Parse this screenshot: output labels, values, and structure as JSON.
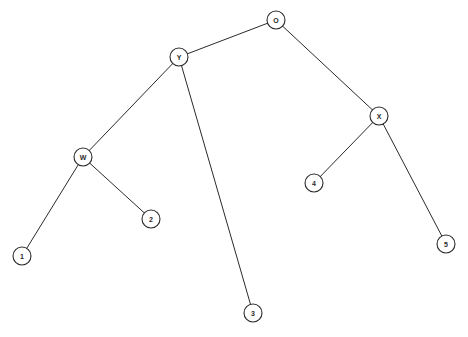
{
  "diagram": {
    "type": "tree",
    "node_radius": 9,
    "colors": {
      "stroke": "#2a2a2a",
      "fill": "#ffffff",
      "background": "#ffffff"
    },
    "nodes": [
      {
        "id": "O",
        "label": "O",
        "x": 276,
        "y": 20
      },
      {
        "id": "Y",
        "label": "Y",
        "x": 179,
        "y": 57
      },
      {
        "id": "X",
        "label": "X",
        "x": 379,
        "y": 116
      },
      {
        "id": "W",
        "label": "W",
        "x": 83,
        "y": 157
      },
      {
        "id": "4",
        "label": "4",
        "x": 314,
        "y": 183
      },
      {
        "id": "2",
        "label": "2",
        "x": 151,
        "y": 219
      },
      {
        "id": "1",
        "label": "1",
        "x": 22,
        "y": 256
      },
      {
        "id": "5",
        "label": "5",
        "x": 446,
        "y": 244
      },
      {
        "id": "3",
        "label": "3",
        "x": 253,
        "y": 313
      }
    ],
    "edges": [
      {
        "from": "O",
        "to": "Y"
      },
      {
        "from": "O",
        "to": "X"
      },
      {
        "from": "Y",
        "to": "W"
      },
      {
        "from": "Y",
        "to": "3"
      },
      {
        "from": "W",
        "to": "1"
      },
      {
        "from": "W",
        "to": "2"
      },
      {
        "from": "X",
        "to": "4"
      },
      {
        "from": "X",
        "to": "5"
      }
    ]
  }
}
